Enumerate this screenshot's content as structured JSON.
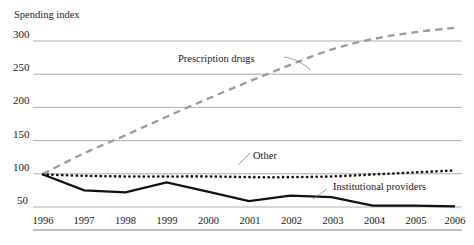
{
  "chart_data": {
    "type": "line",
    "title": "",
    "subtitle": "",
    "ylabel": "Spending index",
    "xlabel": "",
    "grid": true,
    "legend_position": "inline-annotations",
    "x": [
      1996,
      1997,
      1998,
      1999,
      2000,
      2001,
      2002,
      2003,
      2004,
      2005,
      2006
    ],
    "xtick_labels": [
      "1996",
      "1997",
      "1998",
      "1999",
      "2000",
      "2001",
      "2002",
      "2003",
      "2004",
      "2005",
      "2006"
    ],
    "ytick_labels": [
      "300",
      "250",
      "200",
      "150",
      "100",
      "50"
    ],
    "yticks": [
      300,
      250,
      200,
      150,
      100,
      50
    ],
    "ylim": [
      27,
      313
    ],
    "xlim": [
      1996,
      2006
    ],
    "series": [
      {
        "name": "Prescription drugs",
        "style": "dashed",
        "color": "#9a9a9a",
        "values": [
          100,
          131,
          158,
          186,
          213,
          239,
          264,
          287,
          303,
          313,
          320
        ]
      },
      {
        "name": "Other",
        "style": "dotted",
        "color": "#111111",
        "values": [
          99,
          97,
          96,
          96,
          96,
          95,
          95,
          96,
          99,
          102,
          105
        ]
      },
      {
        "name": "Institutional providers",
        "style": "solid",
        "color": "#111111",
        "values": [
          99,
          75,
          72,
          87,
          73,
          59,
          67,
          65,
          52,
          52,
          51
        ]
      }
    ],
    "annotations": [
      {
        "text": "Prescription drugs",
        "series": "Prescription drugs"
      },
      {
        "text": "Other",
        "series": "Other"
      },
      {
        "text": "Institutional providers",
        "series": "Institutional providers"
      }
    ]
  }
}
